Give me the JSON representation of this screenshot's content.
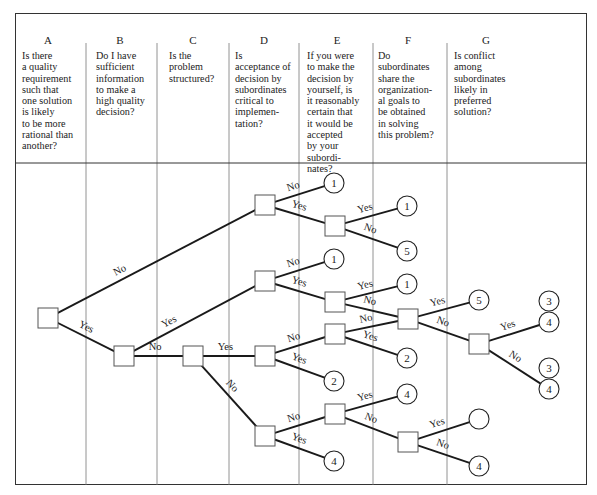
{
  "columns": [
    {
      "letter": "A",
      "question": "Is there\na quality\nrequirement\nsuch that\none solution\nis likely\nto be more\nrational than\nanother?"
    },
    {
      "letter": "B",
      "question": "Do I have\nsufficient\ninformation\nto make a\nhigh quality\ndecision?"
    },
    {
      "letter": "C",
      "question": "Is the\nproblem\nstructured?"
    },
    {
      "letter": "D",
      "question": "Is\nacceptance of\ndecision by\nsubordinates\ncritical to\nimplemen-\ntation?"
    },
    {
      "letter": "E",
      "question": "If you were\nto make the\ndecision by\nyourself, is\nit reasonably\ncertain that\nit would be\naccepted\nby your\nsubordi-\nnates?"
    },
    {
      "letter": "F",
      "question": "Do\nsubordinates\nshare the\norganization-\nal goals to\nbe obtained\nin solving\nthis problem?"
    },
    {
      "letter": "G",
      "question": "Is conflict\namong\nsubordinates\nlikely in\npreferred\nsolution?"
    }
  ],
  "labels": {
    "yes": "Yes",
    "no": "No"
  },
  "colors": {
    "line": "#1a1a1a",
    "frame": "#333333",
    "divider": "#777777",
    "box_border": "#555555"
  },
  "tree": {
    "nodes": [
      {
        "id": "A",
        "x": 48,
        "y": 318
      },
      {
        "id": "B",
        "x": 124,
        "y": 356
      },
      {
        "id": "C",
        "x": 193,
        "y": 356
      },
      {
        "id": "D1",
        "x": 265,
        "y": 205
      },
      {
        "id": "D2",
        "x": 265,
        "y": 281
      },
      {
        "id": "D3",
        "x": 265,
        "y": 356
      },
      {
        "id": "D4",
        "x": 265,
        "y": 436
      },
      {
        "id": "E1",
        "x": 335,
        "y": 226
      },
      {
        "id": "E2",
        "x": 335,
        "y": 302
      },
      {
        "id": "E3",
        "x": 335,
        "y": 334
      },
      {
        "id": "E4",
        "x": 335,
        "y": 414
      },
      {
        "id": "F1",
        "x": 408,
        "y": 319
      },
      {
        "id": "F2",
        "x": 408,
        "y": 442
      },
      {
        "id": "G1",
        "x": 479,
        "y": 344
      }
    ],
    "outcomes": [
      {
        "id": "o1",
        "x": 334,
        "y": 183,
        "label": "1"
      },
      {
        "id": "o2",
        "x": 407,
        "y": 206,
        "label": "1"
      },
      {
        "id": "o3",
        "x": 407,
        "y": 251,
        "label": "5"
      },
      {
        "id": "o4",
        "x": 334,
        "y": 259,
        "label": "1"
      },
      {
        "id": "o5",
        "x": 407,
        "y": 284,
        "label": "1"
      },
      {
        "id": "o6",
        "x": 479,
        "y": 300,
        "label": "5"
      },
      {
        "id": "o7",
        "x": 407,
        "y": 358,
        "label": "2"
      },
      {
        "id": "o8",
        "x": 334,
        "y": 381,
        "label": "2"
      },
      {
        "id": "o9",
        "x": 407,
        "y": 394,
        "label": "4"
      },
      {
        "id": "o10",
        "x": 334,
        "y": 461,
        "label": "4"
      },
      {
        "id": "o11",
        "x": 479,
        "y": 419,
        "label": ""
      },
      {
        "id": "o12",
        "x": 479,
        "y": 466,
        "label": "4"
      },
      {
        "id": "o13",
        "x": 549,
        "y": 301,
        "label": "3"
      },
      {
        "id": "o14",
        "x": 549,
        "y": 322,
        "label": "4"
      },
      {
        "id": "o15",
        "x": 549,
        "y": 368,
        "label": "3"
      },
      {
        "id": "o16",
        "x": 549,
        "y": 389,
        "label": "4"
      }
    ],
    "edges": [
      {
        "from": "A",
        "to": "D1",
        "label": "No"
      },
      {
        "from": "A",
        "to": "B",
        "label": "Yes"
      },
      {
        "from": "B",
        "to": "D2",
        "label": "Yes"
      },
      {
        "from": "B",
        "to": "C",
        "label": "No"
      },
      {
        "from": "C",
        "to": "D3",
        "label": "Yes"
      },
      {
        "from": "C",
        "to": "D4",
        "label": "No"
      },
      {
        "from": "D1",
        "to": "o1",
        "label": "No"
      },
      {
        "from": "D1",
        "to": "E1",
        "label": "Yes"
      },
      {
        "from": "E1",
        "to": "o2",
        "label": "Yes"
      },
      {
        "from": "E1",
        "to": "o3",
        "label": "No"
      },
      {
        "from": "D2",
        "to": "o4",
        "label": "No"
      },
      {
        "from": "D2",
        "to": "E2",
        "label": "Yes"
      },
      {
        "from": "E2",
        "to": "o5",
        "label": "Yes"
      },
      {
        "from": "E2",
        "to": "F1",
        "label": "No"
      },
      {
        "from": "D3",
        "to": "E3",
        "label": "No"
      },
      {
        "from": "D3",
        "to": "o8",
        "label": "Yes"
      },
      {
        "from": "E3",
        "to": "F1",
        "label": "No"
      },
      {
        "from": "E3",
        "to": "o7",
        "label": "Yes"
      },
      {
        "from": "F1",
        "to": "o6",
        "label": "Yes"
      },
      {
        "from": "F1",
        "to": "G1",
        "label": "No"
      },
      {
        "from": "G1",
        "to": "o14",
        "label": "Yes"
      },
      {
        "from": "G1",
        "to": "o16",
        "label": "No"
      },
      {
        "from": "D4",
        "to": "E4",
        "label": "No"
      },
      {
        "from": "D4",
        "to": "o10",
        "label": "Yes"
      },
      {
        "from": "E4",
        "to": "o9",
        "label": "Yes"
      },
      {
        "from": "E4",
        "to": "F2",
        "label": "No"
      },
      {
        "from": "F2",
        "to": "o11",
        "label": "Yes"
      },
      {
        "from": "F2",
        "to": "o12",
        "label": "No"
      }
    ]
  }
}
